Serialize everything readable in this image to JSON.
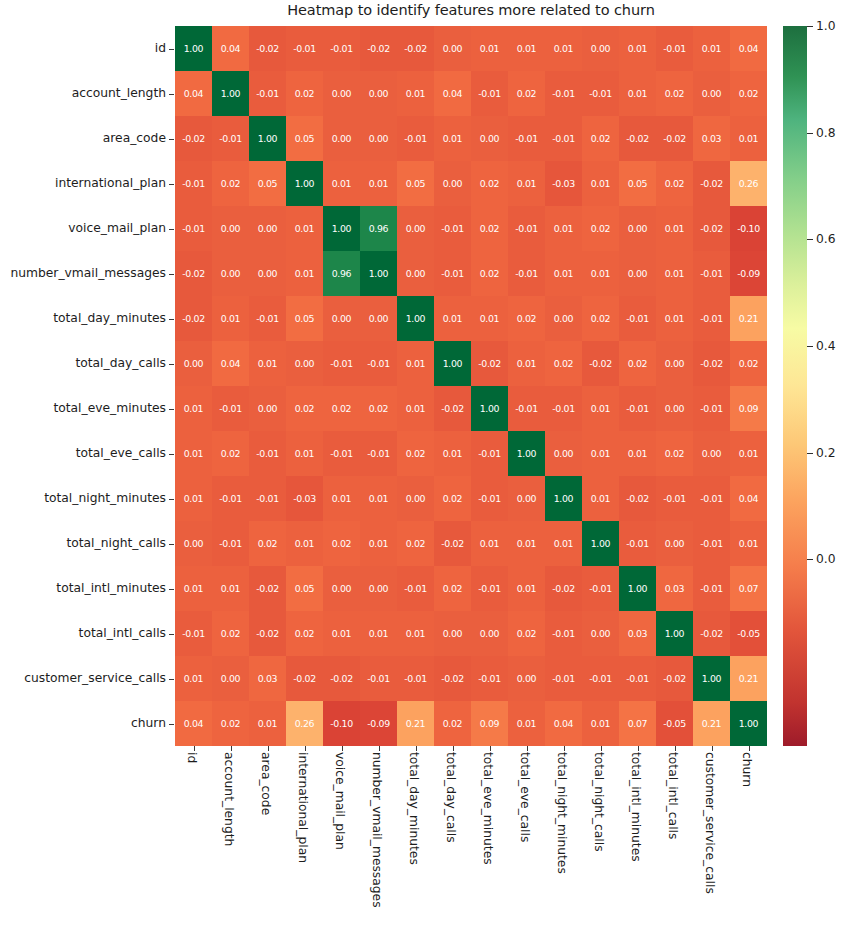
{
  "chart_data": {
    "type": "heatmap",
    "title": "Heatmap to identify features more related to churn",
    "xlabel": "",
    "ylabel": "",
    "grid": false,
    "legend_position": "right",
    "colormap": "RdYlGn",
    "colorbar": {
      "ticks": [
        "1.0",
        "0.8",
        "0.6",
        "0.4",
        "0.2",
        "0.0"
      ],
      "tick_values": [
        1.0,
        0.8,
        0.6,
        0.4,
        0.2,
        0.0
      ],
      "vmin": -0.35,
      "vmax": 1.0
    },
    "categories": [
      "id",
      "account_length",
      "area_code",
      "international_plan",
      "voice_mail_plan",
      "number_vmail_messages",
      "total_day_minutes",
      "total_day_calls",
      "total_eve_minutes",
      "total_eve_calls",
      "total_night_minutes",
      "total_night_calls",
      "total_intl_minutes",
      "total_intl_calls",
      "customer_service_calls",
      "churn"
    ],
    "xticklabels": [
      "id",
      "account_length",
      "area_code",
      "international_plan",
      "voice_mail_plan",
      "number_vmail_messages",
      "total_day_minutes",
      "total_day_calls",
      "total_eve_minutes",
      "total_eve_calls",
      "total_night_minutes",
      "total_night_calls",
      "total_intl_minutes",
      "total_intl_calls",
      "customer_service_calls",
      "churn"
    ],
    "yticklabels": [
      "id",
      "account_length",
      "area_code",
      "international_plan",
      "voice_mail_plan",
      "number_vmail_messages",
      "total_day_minutes",
      "total_day_calls",
      "total_eve_minutes",
      "total_eve_calls",
      "total_night_minutes",
      "total_night_calls",
      "total_intl_minutes",
      "total_intl_calls",
      "customer_service_calls",
      "churn"
    ],
    "values": [
      [
        1.0,
        0.04,
        -0.02,
        -0.01,
        -0.01,
        -0.02,
        -0.02,
        0.0,
        0.01,
        0.01,
        0.01,
        0.0,
        0.01,
        -0.01,
        0.01,
        0.04
      ],
      [
        0.04,
        1.0,
        -0.01,
        0.02,
        0.0,
        -0.0,
        0.01,
        0.04,
        -0.01,
        0.02,
        -0.01,
        -0.01,
        0.01,
        0.02,
        -0.0,
        0.02
      ],
      [
        -0.02,
        -0.01,
        1.0,
        0.05,
        -0.0,
        -0.0,
        -0.01,
        0.01,
        0.0,
        -0.01,
        -0.01,
        0.02,
        -0.02,
        -0.02,
        0.03,
        0.01
      ],
      [
        -0.01,
        0.02,
        0.05,
        1.0,
        0.01,
        0.01,
        0.05,
        0.0,
        0.02,
        0.01,
        -0.03,
        0.01,
        0.05,
        0.02,
        -0.02,
        0.26
      ],
      [
        -0.01,
        0.0,
        -0.0,
        0.01,
        1.0,
        0.96,
        -0.0,
        -0.01,
        0.02,
        -0.01,
        0.01,
        0.02,
        -0.0,
        0.01,
        -0.02,
        -0.1
      ],
      [
        -0.02,
        -0.0,
        -0.0,
        0.01,
        0.96,
        1.0,
        0.0,
        -0.01,
        0.02,
        -0.01,
        0.01,
        0.01,
        0.0,
        0.01,
        -0.01,
        -0.09
      ],
      [
        -0.02,
        0.01,
        -0.01,
        0.05,
        -0.0,
        0.0,
        1.0,
        0.01,
        0.01,
        0.02,
        0.0,
        0.02,
        -0.01,
        0.01,
        -0.01,
        0.21
      ],
      [
        0.0,
        0.04,
        0.01,
        0.0,
        -0.01,
        -0.01,
        0.01,
        1.0,
        -0.02,
        0.01,
        0.02,
        -0.02,
        0.02,
        0.0,
        -0.02,
        0.02
      ],
      [
        0.01,
        -0.01,
        0.0,
        0.02,
        0.02,
        0.02,
        0.01,
        -0.02,
        1.0,
        -0.01,
        -0.01,
        0.01,
        -0.01,
        0.0,
        -0.01,
        0.09
      ],
      [
        0.01,
        0.02,
        -0.01,
        0.01,
        -0.01,
        -0.01,
        0.02,
        0.01,
        -0.01,
        1.0,
        -0.0,
        0.01,
        0.01,
        0.02,
        0.0,
        0.01
      ],
      [
        0.01,
        -0.01,
        -0.01,
        -0.03,
        0.01,
        0.01,
        0.0,
        0.02,
        -0.01,
        -0.0,
        1.0,
        0.01,
        -0.02,
        -0.01,
        -0.01,
        0.04
      ],
      [
        0.0,
        -0.01,
        0.02,
        0.01,
        0.02,
        0.01,
        0.02,
        -0.02,
        0.01,
        0.01,
        0.01,
        1.0,
        -0.01,
        0.0,
        -0.01,
        0.01
      ],
      [
        0.01,
        0.01,
        -0.02,
        0.05,
        -0.0,
        0.0,
        -0.01,
        0.02,
        -0.01,
        0.01,
        -0.02,
        -0.01,
        1.0,
        0.03,
        -0.01,
        0.07
      ],
      [
        -0.01,
        0.02,
        -0.02,
        0.02,
        0.01,
        0.01,
        0.01,
        0.0,
        0.0,
        0.02,
        -0.01,
        0.0,
        0.03,
        1.0,
        -0.02,
        -0.05
      ],
      [
        0.01,
        -0.0,
        0.03,
        -0.02,
        -0.02,
        -0.01,
        -0.01,
        -0.02,
        -0.01,
        0.0,
        -0.01,
        -0.01,
        -0.01,
        -0.02,
        1.0,
        0.21
      ],
      [
        0.04,
        0.02,
        0.01,
        0.26,
        -0.1,
        -0.09,
        0.21,
        0.02,
        0.09,
        0.01,
        0.04,
        0.01,
        0.07,
        -0.05,
        0.21,
        1.0
      ]
    ],
    "annotations": [
      {
        "row": "voice_mail_plan",
        "col": "number_vmail_messages",
        "value": 0.96
      },
      {
        "row": "churn",
        "col": "international_plan",
        "value": 0.26
      },
      {
        "row": "churn",
        "col": "total_day_minutes",
        "value": 0.21
      },
      {
        "row": "churn",
        "col": "customer_service_calls",
        "value": 0.21
      },
      {
        "row": "churn",
        "col": "voice_mail_plan",
        "value": -0.1
      },
      {
        "row": "churn",
        "col": "number_vmail_messages",
        "value": -0.09
      }
    ]
  }
}
